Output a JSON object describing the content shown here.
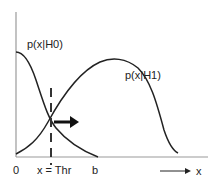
{
  "diagram": {
    "curves": [
      {
        "name": "H0",
        "label": "p(x|H0)"
      },
      {
        "name": "H1",
        "label": "p(x|H1)"
      }
    ],
    "axis": {
      "x_tick_labels": [
        "0",
        "x = Thr",
        "b"
      ],
      "x_axis_label": "x"
    },
    "threshold_label": "x = Thr",
    "colors": {
      "curve": "#222222",
      "axis": "#999999",
      "dashed": "#333333",
      "arrow": "#111111"
    }
  }
}
